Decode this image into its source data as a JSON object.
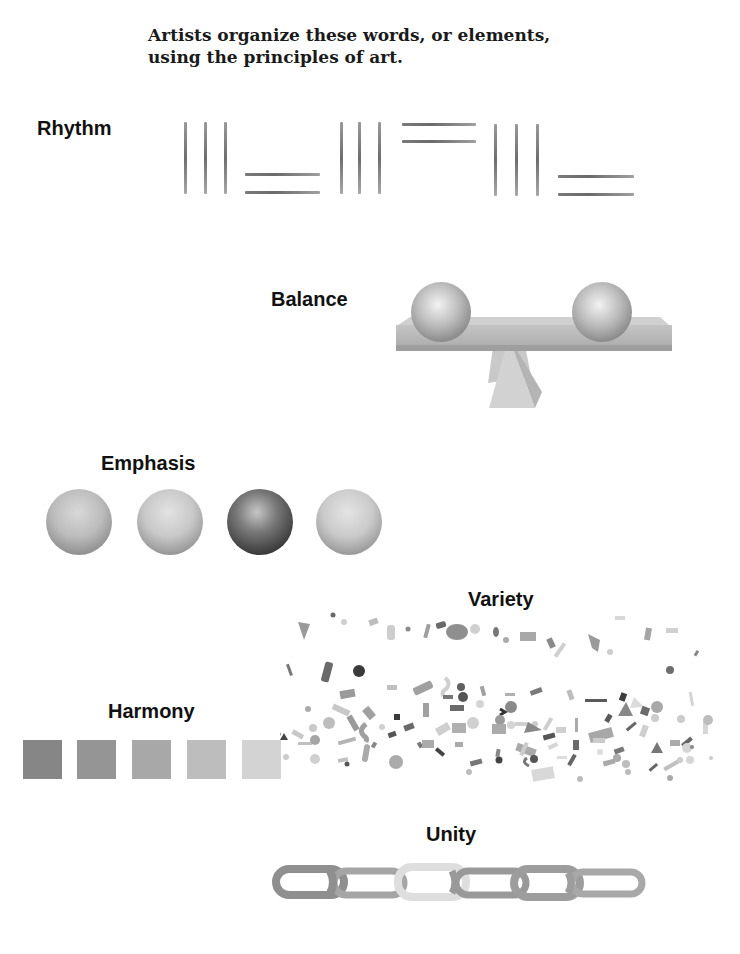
{
  "intro": {
    "line1": "Artists organize these words, or elements,",
    "line2": "using the principles of art."
  },
  "principles": {
    "rhythm": {
      "label": "Rhythm",
      "illustration": "repeating groups of three vertical lines alternating with pairs of horizontal lines"
    },
    "balance": {
      "label": "Balance",
      "illustration": "two equal spheres on a board balanced on a pyramid fulcrum"
    },
    "emphasis": {
      "label": "Emphasis",
      "illustration": "four spheres, third one dark",
      "sphere_shades": [
        "#b9b9b9",
        "#c6c6c6",
        "#4a4a4a",
        "#c8c8c8"
      ]
    },
    "variety": {
      "label": "Variety",
      "illustration": "scattered confetti of varied shapes and grays"
    },
    "harmony": {
      "label": "Harmony",
      "illustration": "five gray squares from dark to light",
      "swatch_colors": [
        "#868686",
        "#959595",
        "#a8a8a8",
        "#bdbdbd",
        "#d3d3d3"
      ]
    },
    "unity": {
      "label": "Unity",
      "illustration": "chain of six interlocking links, third link light",
      "link_colors": [
        "#8f8f8f",
        "#a5a5a5",
        "#dedede",
        "#999999",
        "#9d9d9d",
        "#a8a8a8"
      ]
    }
  }
}
